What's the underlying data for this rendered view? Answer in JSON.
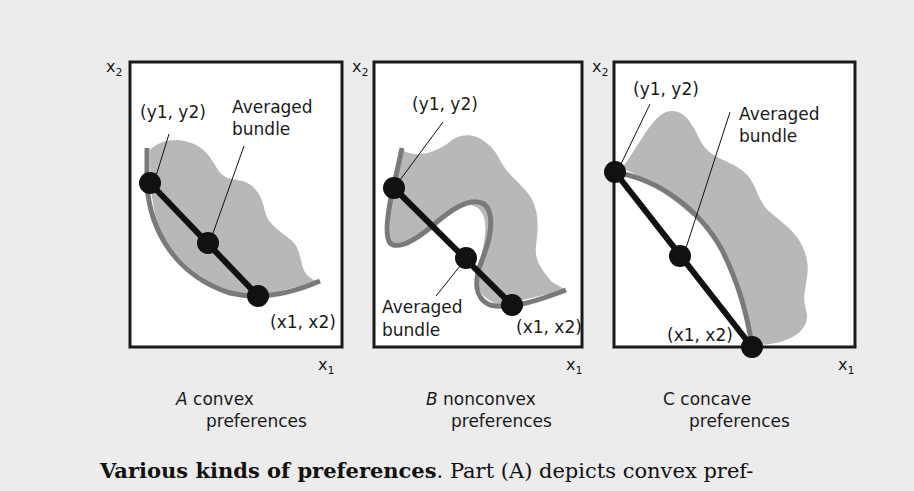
{
  "figure": {
    "colors": {
      "background": "#ececec",
      "plot_background": "#ffffff",
      "preferred_set_fill": "#b8b8b8",
      "indifference_curve": "#7a7a7a",
      "segment_and_points": "#111111",
      "axes": "#1a1a1a"
    },
    "panels": [
      {
        "id": "A",
        "letter": "A",
        "title_word": "convex",
        "title_line2": "preferences",
        "x_axis_label": "x1",
        "y_axis_label": "x2",
        "point_y_label": "(y1, y2)",
        "point_x_label": "(x1, x2)",
        "averaged_label_line1": "Averaged",
        "averaged_label_line2": "bundle"
      },
      {
        "id": "B",
        "letter": "B",
        "title_word": "nonconvex",
        "title_line2": "preferences",
        "x_axis_label": "x1",
        "y_axis_label": "x2",
        "point_y_label": "(y1, y2)",
        "point_x_label": "(x1, x2)",
        "averaged_label_line1": "Averaged",
        "averaged_label_line2": "bundle"
      },
      {
        "id": "C",
        "letter": "C",
        "title_word": "concave",
        "title_line2": "preferences",
        "x_axis_label": "x1",
        "y_axis_label": "x2",
        "point_y_label": "(y1, y2)",
        "point_x_label": "(x1, x2)",
        "averaged_label_line1": "Averaged",
        "averaged_label_line2": "bundle"
      }
    ],
    "caption": {
      "bold": "Various kinds of preferences",
      "rest": ".  Part (A) depicts convex pref-"
    }
  }
}
